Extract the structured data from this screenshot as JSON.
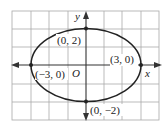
{
  "diagram": {
    "type": "ellipse-graph",
    "equation_implied": "x^2/9 + y^2/4 = 1",
    "axes": {
      "x_label": "x",
      "y_label": "y",
      "origin_label": "O"
    },
    "grid": {
      "x_range": [
        -4,
        4
      ],
      "y_range": [
        -3,
        3
      ],
      "cell_units": 1
    },
    "points": [
      {
        "label": "(0, 2)",
        "x": 0,
        "y": 2
      },
      {
        "label": "(3, 0)",
        "x": 3,
        "y": 0
      },
      {
        "label": "(-3, 0)",
        "display": "(−3, 0)",
        "x": -3,
        "y": 0
      },
      {
        "label": "(0, -2)",
        "display": "(0, −2)",
        "x": 0,
        "y": -2
      }
    ],
    "labels": {
      "top": "(0, 2)",
      "right": "(3, 0)",
      "left": "(−3, 0)",
      "bottom": "(0, −2)"
    },
    "colors": {
      "grid": "#a9a9a9",
      "curve": "#222222",
      "axis": "#333333"
    }
  }
}
